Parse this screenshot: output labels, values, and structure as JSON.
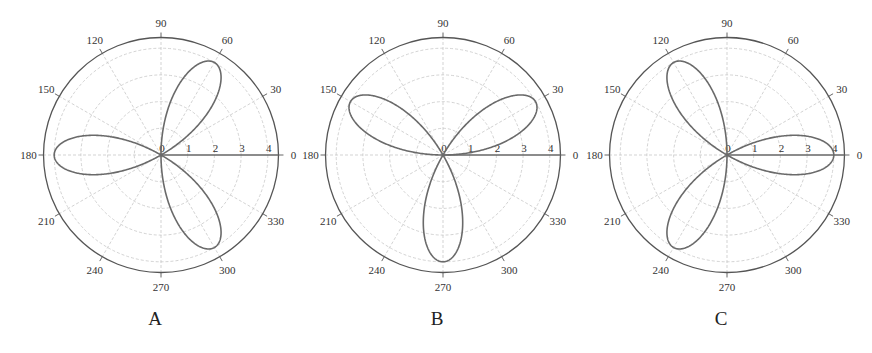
{
  "figure": {
    "panels": [
      {
        "label": "A",
        "cx": 161,
        "cy": 155
      },
      {
        "label": "B",
        "cx": 443,
        "cy": 155
      },
      {
        "label": "C",
        "cx": 727,
        "cy": 155
      }
    ],
    "colors": {
      "curve": "#6a6a6a",
      "grid": "#c8c8c8",
      "outer_circle": "#555555",
      "axis": "#666666",
      "text": "#333333"
    }
  },
  "chart_data": [
    {
      "type": "polar-line",
      "title": "A",
      "equation": "r = 4 cos(3(θ - 60°))",
      "petal_angles_deg": [
        60,
        180,
        300
      ],
      "petal_length": 4,
      "radial_ticks": [
        0,
        1,
        2,
        3,
        4
      ],
      "angle_ticks_deg": [
        0,
        30,
        60,
        90,
        120,
        150,
        180,
        210,
        240,
        270,
        300,
        330
      ],
      "rlim": [
        0,
        4.4
      ],
      "grid": true
    },
    {
      "type": "polar-line",
      "title": "B",
      "equation": "r = 4 sin(3θ)",
      "petal_angles_deg": [
        30,
        150,
        270
      ],
      "petal_length": 4,
      "radial_ticks": [
        0,
        1,
        2,
        3,
        4
      ],
      "angle_ticks_deg": [
        0,
        30,
        60,
        90,
        120,
        150,
        180,
        210,
        240,
        270,
        300,
        330
      ],
      "rlim": [
        0,
        4.4
      ],
      "grid": true
    },
    {
      "type": "polar-line",
      "title": "C",
      "equation": "r = 4 cos(3θ)",
      "petal_angles_deg": [
        0,
        120,
        240
      ],
      "petal_length": 4,
      "radial_ticks": [
        0,
        1,
        2,
        3,
        4
      ],
      "angle_ticks_deg": [
        0,
        30,
        60,
        90,
        120,
        150,
        180,
        210,
        240,
        270,
        300,
        330
      ],
      "rlim": [
        0,
        4.4
      ],
      "grid": true
    }
  ]
}
